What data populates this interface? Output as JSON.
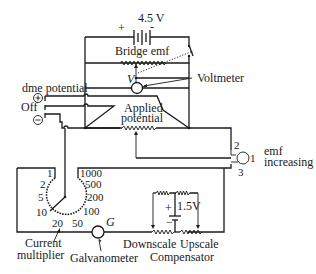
{
  "diagram": {
    "battery_main": {
      "voltage": "4.5 V",
      "plus": "+",
      "minus": "-"
    },
    "bridge_emf": "Bridge emf",
    "voltmeter": {
      "symbol": "V",
      "label": "Voltmeter"
    },
    "dme_switch": {
      "label": "dme potential",
      "plus": "⊕",
      "off": "Off",
      "minus": "⊖"
    },
    "applied_potential": {
      "line1": "Applied",
      "line2": "potential"
    },
    "emf_switch": {
      "pos1": "1",
      "pos2": "2",
      "pos3": "3",
      "label1": "emf",
      "label2": "increasing"
    },
    "current_multiplier": {
      "label1": "Current",
      "label2": "multiplier",
      "left_scale": [
        "1",
        "2",
        "5",
        "10",
        "20"
      ],
      "right_scale": [
        "1000",
        "500",
        "200",
        "100",
        "50"
      ]
    },
    "galvanometer": {
      "symbol": "G",
      "label": "Galvanometer"
    },
    "compensator": {
      "battery": "1.5V",
      "plus": "+",
      "minus": "−",
      "downscale": "Downscale",
      "upscale": "Upscale",
      "label": "Compensator"
    }
  }
}
